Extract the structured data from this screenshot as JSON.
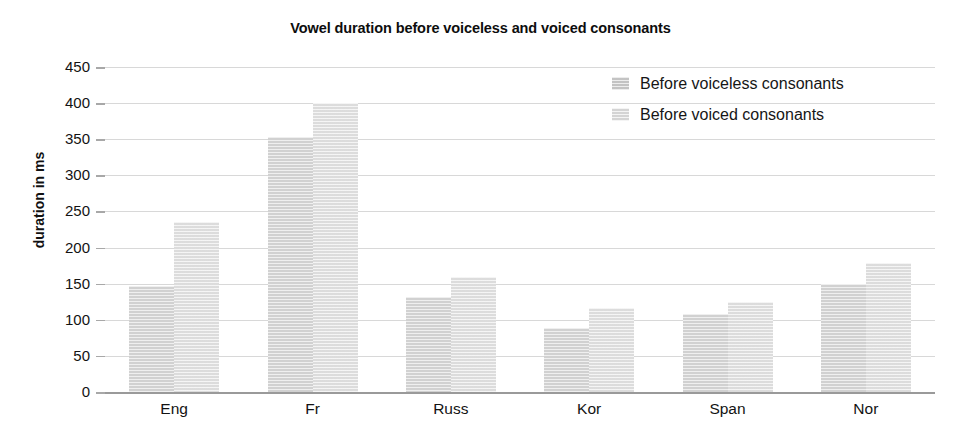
{
  "chart_data": {
    "type": "bar",
    "title": "Vowel duration before voiceless and voiced consonants",
    "xlabel": "",
    "ylabel": "duration in ms",
    "categories": [
      "Eng",
      "Fr",
      "Russ",
      "Kor",
      "Span",
      "Nor"
    ],
    "series": [
      {
        "name": "Before voiceless consonants",
        "color": "#dcdcdc",
        "values": [
          147,
          353,
          131,
          88,
          108,
          150
        ]
      },
      {
        "name": "Before voiced consonants",
        "color": "#e8e8e8",
        "values": [
          235,
          400,
          159,
          117,
          125,
          178
        ]
      }
    ],
    "ylim": [
      0,
      450
    ],
    "ytick_step": 50,
    "yticks": [
      450,
      400,
      350,
      300,
      250,
      200,
      150,
      100,
      50,
      0
    ],
    "grid": true,
    "legend_position": "top-right"
  }
}
